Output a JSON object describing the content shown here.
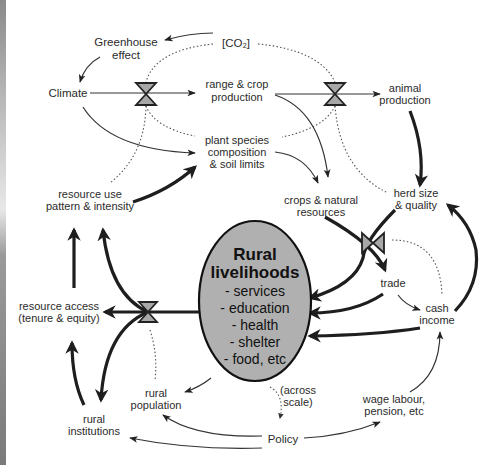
{
  "figure": {
    "type": "causal-loop diagram",
    "nodes": {
      "co2": "[CO₂]",
      "greenhouse_1": "Greenhouse",
      "greenhouse_2": "effect",
      "climate": "Climate",
      "range_crop_1": "range & crop",
      "range_crop_2": "production",
      "animal_1": "animal",
      "animal_2": "production",
      "plant_1": "plant species",
      "plant_2": "composition",
      "plant_3": "& soil limits",
      "resource_use_1": "resource use",
      "resource_use_2": "pattern & intensity",
      "crops_1": "crops & natural",
      "crops_2": "resources",
      "herd_1": "herd size",
      "herd_2": "& quality",
      "trade": "trade",
      "cash_1": "cash",
      "cash_2": "income",
      "access_1": "resource access",
      "access_2": "(tenure & equity)",
      "population_1": "rural",
      "population_2": "population",
      "institutions_1": "rural",
      "institutions_2": "institutions",
      "across_1": "(across",
      "across_2": "scale)",
      "policy": "Policy",
      "wage_1": "wage labour,",
      "wage_2": "pension, etc"
    },
    "center": {
      "title_1": "Rural",
      "title_2": "livelihoods",
      "items": [
        "- services",
        "- education",
        "- health",
        "- shelter",
        "- food, etc"
      ],
      "fill": "#b0b0b0"
    },
    "edge_styles": {
      "thin": "direct influence",
      "thick": "strong livelihood flow",
      "dotted": "modulating influence"
    }
  }
}
